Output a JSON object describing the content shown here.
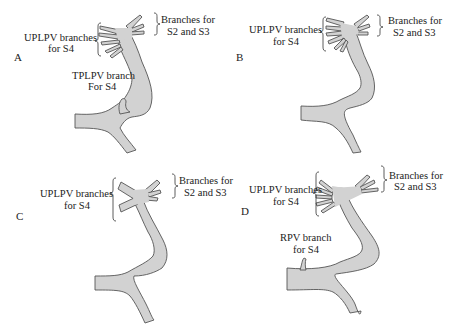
{
  "figure": {
    "colors": {
      "vessel_fill": "#d2d2d2",
      "vessel_outline": "#555555",
      "text": "#222222",
      "background": "#ffffff"
    },
    "panels": [
      {
        "letter": "A",
        "labels": {
          "uplpv_line1": "UPLPV branches",
          "uplpv_line2": "for S4",
          "s2s3_line1": "Branches for",
          "s2s3_line2": "S2 and S3",
          "extra_line1": "TPLPV branch",
          "extra_line2": "For S4"
        }
      },
      {
        "letter": "B",
        "labels": {
          "uplpv_line1": "UPLPV branches",
          "uplpv_line2": "for S4",
          "s2s3_line1": "Branches for",
          "s2s3_line2": "S2 and S3"
        }
      },
      {
        "letter": "C",
        "labels": {
          "uplpv_line1": "UPLPV branches",
          "uplpv_line2": "for S4",
          "s2s3_line1": "Branches for",
          "s2s3_line2": "S2 and S3"
        }
      },
      {
        "letter": "D",
        "labels": {
          "uplpv_line1": "UPLPV branches",
          "uplpv_line2": "for S4",
          "s2s3_line1": "Branches for",
          "s2s3_line2": "S2 and S3",
          "extra_line1": "RPV branch",
          "extra_line2": "for S4"
        }
      }
    ]
  }
}
